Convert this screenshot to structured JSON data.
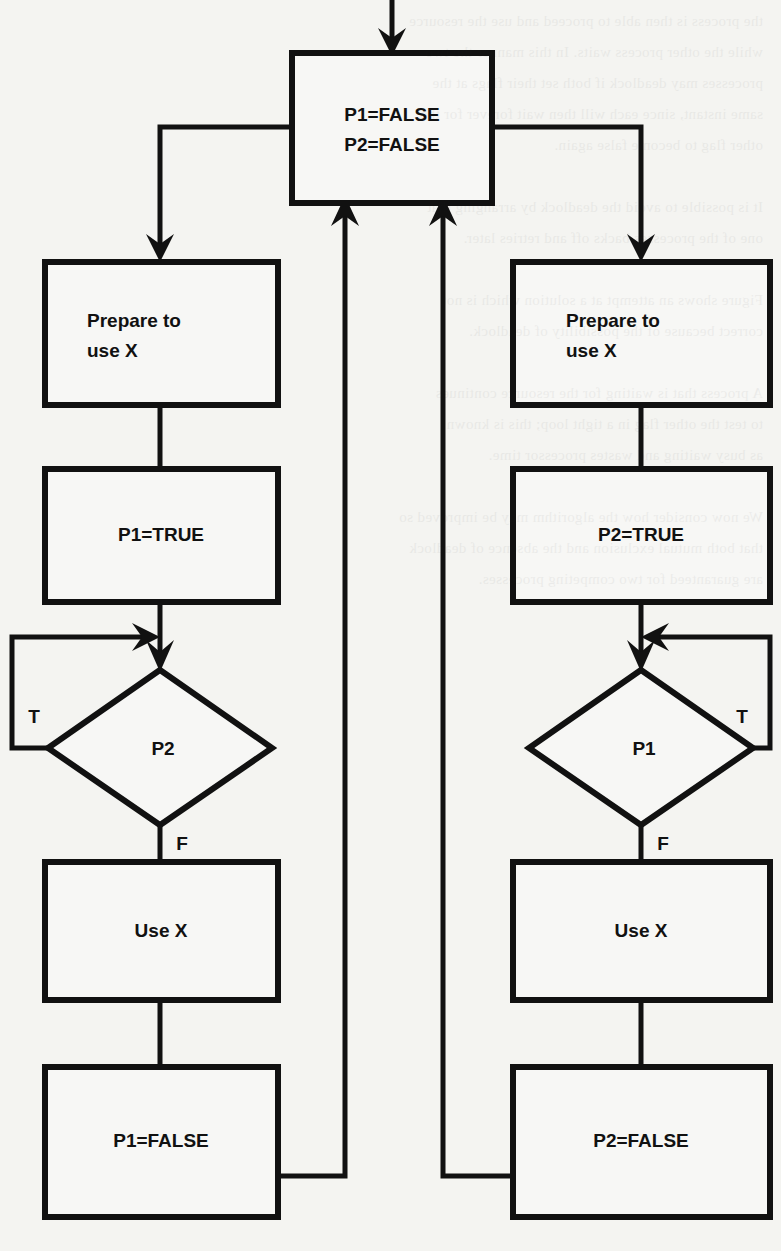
{
  "page": {
    "background_color": "#f4f4f1",
    "ink_color": "#111111"
  },
  "diagram": {
    "type": "flowchart",
    "orientation": "two-parallel-branches",
    "nodes": [
      {
        "id": "init",
        "shape": "process",
        "label_line1": "P1=FALSE",
        "label_line2": "P2=FALSE"
      },
      {
        "id": "prep-left",
        "shape": "process",
        "label_line1": "Prepare to",
        "label_line2": "use X"
      },
      {
        "id": "p1-true",
        "shape": "process",
        "label_line1": "P1=TRUE"
      },
      {
        "id": "decide-p2",
        "shape": "decision",
        "label_line1": "P2"
      },
      {
        "id": "use-x-left",
        "shape": "process",
        "label_line1": "Use X"
      },
      {
        "id": "p1-false",
        "shape": "process",
        "label_line1": "P1=FALSE"
      },
      {
        "id": "prep-right",
        "shape": "process",
        "label_line1": "Prepare to",
        "label_line2": "use X"
      },
      {
        "id": "p2-true",
        "shape": "process",
        "label_line1": "P2=TRUE"
      },
      {
        "id": "decide-p1",
        "shape": "decision",
        "label_line1": "P1"
      },
      {
        "id": "use-x-right",
        "shape": "process",
        "label_line1": "Use X"
      },
      {
        "id": "p2-false",
        "shape": "process",
        "label_line1": "P2=FALSE"
      }
    ],
    "edge_labels": {
      "decide_p2_true": "T",
      "decide_p2_false": "F",
      "decide_p1_true": "T",
      "decide_p1_false": "F"
    },
    "edges": [
      {
        "from": "entry",
        "to": "init",
        "label": ""
      },
      {
        "from": "init",
        "to": "prep-left",
        "label": ""
      },
      {
        "from": "init",
        "to": "prep-right",
        "label": ""
      },
      {
        "from": "prep-left",
        "to": "p1-true",
        "label": ""
      },
      {
        "from": "p1-true",
        "to": "decide-p2",
        "label": ""
      },
      {
        "from": "decide-p2",
        "to": "decide-p2",
        "label": "T"
      },
      {
        "from": "decide-p2",
        "to": "use-x-left",
        "label": "F"
      },
      {
        "from": "use-x-left",
        "to": "p1-false",
        "label": ""
      },
      {
        "from": "p1-false",
        "to": "init",
        "label": ""
      },
      {
        "from": "prep-right",
        "to": "p2-true",
        "label": ""
      },
      {
        "from": "p2-true",
        "to": "decide-p1",
        "label": ""
      },
      {
        "from": "decide-p1",
        "to": "decide-p1",
        "label": "T"
      },
      {
        "from": "decide-p1",
        "to": "use-x-right",
        "label": "F"
      },
      {
        "from": "use-x-right",
        "to": "p2-false",
        "label": ""
      },
      {
        "from": "p2-false",
        "to": "init",
        "label": ""
      }
    ]
  },
  "bleed_text": "the process is then able to proceed and use the resource\nwhile the other process waits. In this manner the two\nprocesses may deadlock if both set their flags at the\nsame instant, since each will then wait forever for the\nother flag to become false again.\n\nIt is possible to avoid the deadlock by arranging that\none of the processes backs off and retries later.\n\nFigure shows an attempt at a solution which is not\ncorrect because of the possibility of deadlock.\n\nA process that is waiting for the resource continues\nto test the other flag in a tight loop; this is known\nas busy waiting and wastes processor time.\n\nWe now consider how the algorithm may be improved so\nthat both mutual exclusion and the absence of deadlock\nare guaranteed for two competing processes."
}
